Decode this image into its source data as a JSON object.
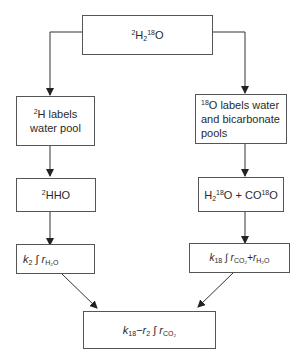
{
  "diagram": {
    "top": {
      "iso_h": "2",
      "h": "H",
      "h_sub": "2",
      "iso_o": "18",
      "o": "O"
    },
    "left1": {
      "iso": "2",
      "line1": "H labels",
      "line2": "water pool"
    },
    "right1": {
      "iso": "18",
      "line1": "O labels water",
      "line2": "and bicarbonate",
      "line3": "pools"
    },
    "left2": {
      "iso": "2",
      "text": "HHO"
    },
    "right2": {
      "h": "H",
      "h_sub": "2",
      "iso1": "18",
      "o1": "O + CO",
      "iso2": "18",
      "o2": "O"
    },
    "left3": {
      "k": "k",
      "k_sub": "2",
      "int": "∫",
      "r": "r",
      "r_sub": "H₂O"
    },
    "right3": {
      "k": "k",
      "k_sub": "18",
      "int": "∫",
      "r1": "r",
      "r1_sub": "CO₂",
      "plus": "+",
      "r2": "r",
      "r2_sub": "H₂O"
    },
    "bottom": {
      "k": "k",
      "k_sub": "18",
      "minus": "−",
      "r": "r",
      "r_sub": "2",
      "int": "∫",
      "r2": "r",
      "r2_sub": "CO₂"
    }
  }
}
